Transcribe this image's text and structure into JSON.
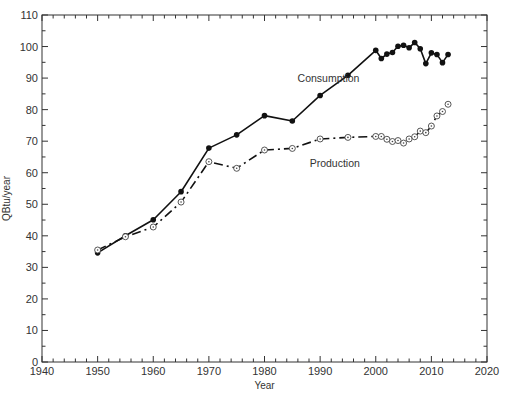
{
  "chart_data": {
    "type": "line",
    "title": "",
    "xlabel": "Year",
    "ylabel": "QBtu/year",
    "xlim": [
      1940,
      2020
    ],
    "ylim": [
      0,
      110
    ],
    "x_ticks": [
      1940,
      1950,
      1960,
      1970,
      1980,
      1990,
      2000,
      2010,
      2020
    ],
    "x_tick_labels": [
      "1940",
      "1950",
      "1960",
      "1970",
      "1980",
      "1990",
      "2000",
      "2010",
      "2020"
    ],
    "y_ticks": [
      0,
      10,
      20,
      30,
      40,
      50,
      60,
      70,
      80,
      90,
      100,
      110
    ],
    "y_tick_labels": [
      "0",
      "10",
      "20",
      "30",
      "40",
      "50",
      "60",
      "70",
      "80",
      "90",
      "100",
      "110"
    ],
    "x_minor_step": 2,
    "y_minor_step": 5,
    "grid": false,
    "series": [
      {
        "name": "Consumption",
        "style": "solid",
        "marker": "filled-circle",
        "color": "#111111",
        "x": [
          1950,
          1955,
          1960,
          1965,
          1970,
          1975,
          1980,
          1985,
          1990,
          1995,
          2000,
          2001,
          2002,
          2003,
          2004,
          2005,
          2006,
          2007,
          2008,
          2009,
          2010,
          2011,
          2012,
          2013
        ],
        "values": [
          34.6,
          40.0,
          45.1,
          54.0,
          67.8,
          72.0,
          78.1,
          76.4,
          84.5,
          90.9,
          98.8,
          96.2,
          97.6,
          98.1,
          100.1,
          100.4,
          99.6,
          101.3,
          99.3,
          94.6,
          98.0,
          97.5,
          94.9,
          97.5
        ]
      },
      {
        "name": "Production",
        "style": "dash-dot",
        "marker": "open-circle",
        "color": "#111111",
        "x": [
          1950,
          1955,
          1960,
          1965,
          1970,
          1975,
          1980,
          1985,
          1990,
          1995,
          2000,
          2001,
          2002,
          2003,
          2004,
          2005,
          2006,
          2007,
          2008,
          2009,
          2010,
          2011,
          2012,
          2013
        ],
        "values": [
          35.5,
          39.7,
          42.8,
          50.7,
          63.5,
          61.4,
          67.2,
          67.7,
          70.7,
          71.2,
          71.5,
          71.5,
          70.6,
          69.9,
          70.2,
          69.4,
          70.7,
          71.4,
          73.2,
          72.7,
          74.8,
          78.0,
          79.4,
          81.7
        ]
      }
    ],
    "annotations": [
      {
        "text": "Consumption",
        "x": 1989,
        "y": 90
      },
      {
        "text": "Production",
        "x": 1991,
        "y": 63
      }
    ],
    "legend": "none (inline labels)"
  }
}
